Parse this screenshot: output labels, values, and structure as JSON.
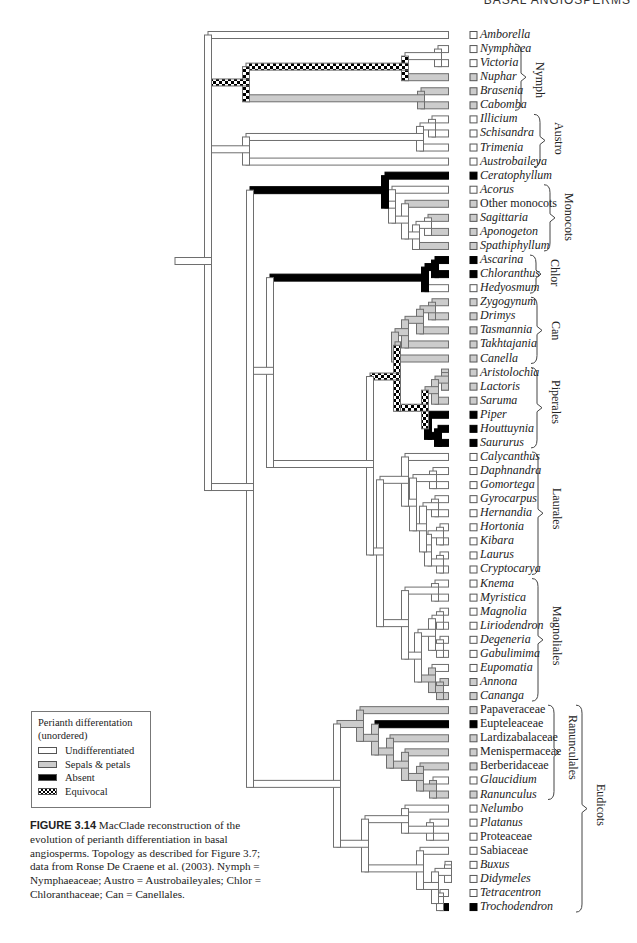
{
  "running_header": "BASAL ANGIOSPERMS",
  "colors": {
    "undifferentiated": "#ffffff",
    "sepals_petals": "#cccccc",
    "absent": "#000000",
    "equivocal": "checker",
    "outline": "#6e6e6e"
  },
  "legend": {
    "title": "Perianth differentation",
    "subtitle": "(unordered)",
    "items": [
      {
        "label": "Undifferentiated",
        "state": "U"
      },
      {
        "label": "Sepals & petals",
        "state": "S"
      },
      {
        "label": "Absent",
        "state": "A"
      },
      {
        "label": "Equivocal",
        "state": "E"
      }
    ]
  },
  "caption": {
    "figure_number": "FIGURE 3.14",
    "text": "MacClade reconstruction of the evolution of perianth differentiation in basal angiosperms. Topology as described for Figure 3.7; data from Ronse De Craene et al. (2003). Nymph = Nymphaeaceae; Austro = Austrobaileyales; Chlor = Chloranthaceae; Can = Canellales."
  },
  "taxa": [
    {
      "name": "Amborella",
      "italic": true,
      "state": "U"
    },
    {
      "name": "Nymphaea",
      "italic": true,
      "state": "U"
    },
    {
      "name": "Victoria",
      "italic": true,
      "state": "U"
    },
    {
      "name": "Nuphar",
      "italic": true,
      "state": "S"
    },
    {
      "name": "Brasenia",
      "italic": true,
      "state": "S"
    },
    {
      "name": "Cabomba",
      "italic": true,
      "state": "S"
    },
    {
      "name": "Illicium",
      "italic": true,
      "state": "U"
    },
    {
      "name": "Schisandra",
      "italic": true,
      "state": "U"
    },
    {
      "name": "Trimenia",
      "italic": true,
      "state": "U"
    },
    {
      "name": "Austrobaileya",
      "italic": true,
      "state": "U"
    },
    {
      "name": "Ceratophyllum",
      "italic": true,
      "state": "A"
    },
    {
      "name": "Acorus",
      "italic": true,
      "state": "U"
    },
    {
      "name": "Other monocots",
      "italic": false,
      "state": "S"
    },
    {
      "name": "Sagittaria",
      "italic": true,
      "state": "S"
    },
    {
      "name": "Aponogeton",
      "italic": true,
      "state": "S"
    },
    {
      "name": "Spathiphyllum",
      "italic": true,
      "state": "S"
    },
    {
      "name": "Ascarina",
      "italic": true,
      "state": "A"
    },
    {
      "name": "Chloranthus",
      "italic": true,
      "state": "A"
    },
    {
      "name": "Hedyosmum",
      "italic": true,
      "state": "U"
    },
    {
      "name": "Zygogynum",
      "italic": true,
      "state": "S"
    },
    {
      "name": "Drimys",
      "italic": true,
      "state": "S"
    },
    {
      "name": "Tasmannia",
      "italic": true,
      "state": "S"
    },
    {
      "name": "Takhtajania",
      "italic": true,
      "state": "S"
    },
    {
      "name": "Canella",
      "italic": true,
      "state": "S"
    },
    {
      "name": "Aristolochia",
      "italic": true,
      "state": "S"
    },
    {
      "name": "Lactoris",
      "italic": true,
      "state": "S"
    },
    {
      "name": "Saruma",
      "italic": true,
      "state": "S"
    },
    {
      "name": "Piper",
      "italic": true,
      "state": "A"
    },
    {
      "name": "Houttuynia",
      "italic": true,
      "state": "A"
    },
    {
      "name": "Saururus",
      "italic": true,
      "state": "A"
    },
    {
      "name": "Calycanthus",
      "italic": true,
      "state": "U"
    },
    {
      "name": "Daphnandra",
      "italic": true,
      "state": "U"
    },
    {
      "name": "Gomortega",
      "italic": true,
      "state": "U"
    },
    {
      "name": "Gyrocarpus",
      "italic": true,
      "state": "U"
    },
    {
      "name": "Hernandia",
      "italic": true,
      "state": "U"
    },
    {
      "name": "Hortonia",
      "italic": true,
      "state": "U"
    },
    {
      "name": "Kibara",
      "italic": true,
      "state": "U"
    },
    {
      "name": "Laurus",
      "italic": true,
      "state": "U"
    },
    {
      "name": "Cryptocarya",
      "italic": true,
      "state": "U"
    },
    {
      "name": "Knema",
      "italic": true,
      "state": "U"
    },
    {
      "name": "Myristica",
      "italic": true,
      "state": "U"
    },
    {
      "name": "Magnolia",
      "italic": true,
      "state": "U"
    },
    {
      "name": "Liriodendron",
      "italic": true,
      "state": "U"
    },
    {
      "name": "Degeneria",
      "italic": true,
      "state": "U"
    },
    {
      "name": "Gabulimima",
      "italic": true,
      "state": "U"
    },
    {
      "name": "Eupomatia",
      "italic": true,
      "state": "U"
    },
    {
      "name": "Annona",
      "italic": true,
      "state": "S"
    },
    {
      "name": "Cananga",
      "italic": true,
      "state": "S"
    },
    {
      "name": "Papaveraceae",
      "italic": false,
      "state": "S"
    },
    {
      "name": "Eupteleaceae",
      "italic": false,
      "state": "A"
    },
    {
      "name": "Lardizabalaceae",
      "italic": false,
      "state": "S"
    },
    {
      "name": "Menispermaceae",
      "italic": false,
      "state": "S"
    },
    {
      "name": "Berberidaceae",
      "italic": false,
      "state": "S"
    },
    {
      "name": "Glaucidium",
      "italic": true,
      "state": "U"
    },
    {
      "name": "Ranunculus",
      "italic": true,
      "state": "S"
    },
    {
      "name": "Nelumbo",
      "italic": true,
      "state": "U"
    },
    {
      "name": "Platanus",
      "italic": true,
      "state": "U"
    },
    {
      "name": "Proteaceae",
      "italic": false,
      "state": "U"
    },
    {
      "name": "Sabiaceae",
      "italic": false,
      "state": "U"
    },
    {
      "name": "Buxus",
      "italic": true,
      "state": "U"
    },
    {
      "name": "Didymeles",
      "italic": true,
      "state": "U"
    },
    {
      "name": "Tetracentron",
      "italic": true,
      "state": "U"
    },
    {
      "name": "Trochodendron",
      "italic": true,
      "state": "A"
    }
  ],
  "clades": [
    {
      "label": "Nymph",
      "from": 1,
      "to": 5,
      "x": 533
    },
    {
      "label": "Austro",
      "from": 6,
      "to": 9,
      "x": 552
    },
    {
      "label": "Monocots",
      "from": 11,
      "to": 15,
      "x": 562
    },
    {
      "label": "Chlor",
      "from": 16,
      "to": 18,
      "x": 548
    },
    {
      "label": "Can",
      "from": 19,
      "to": 23,
      "x": 549
    },
    {
      "label": "Piperales",
      "from": 24,
      "to": 29,
      "x": 549
    },
    {
      "label": "Laurales",
      "from": 30,
      "to": 38,
      "x": 550
    },
    {
      "label": "Magnoliales",
      "from": 39,
      "to": 47,
      "x": 550
    },
    {
      "label": "Ranunculales",
      "from": 48,
      "to": 54,
      "x": 566
    },
    {
      "label": "Eudicots",
      "from": 48,
      "to": 62,
      "x": 594
    }
  ],
  "tree": {
    "newick_like": "(Amborella,(((Nymphaea,Victoria),Nuphar),(Brasenia,Cabomba)),(((Illicium,Schisandra),Trimenia),Austrobaileya),(Ceratophyllum,(Acorus,(Other monocots,((Sagittaria,Aponogeton),Spathiphyllum)))),((Ascarina,Chloranthus),Hedyosmum),((((Zygogynum,Drimys),Tasmannia),Takhtajania),Canella),(((Aristolochia,Lactoris),Saruma),(Piper,(Houttuynia,Saururus))),Laurales,Magnoliales,Eudicots)"
  }
}
